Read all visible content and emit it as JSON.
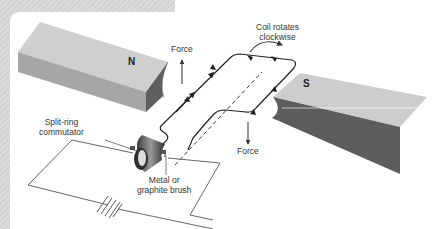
{
  "diagram": {
    "type": "dc-motor",
    "labels": {
      "coil_rotation_line1": "Coil rotates",
      "coil_rotation_line2": "clockwise",
      "force_top": "Force",
      "force_bottom": "Force",
      "north_pole": "N",
      "south_pole": "S",
      "commutator_line1": "Split-ring",
      "commutator_line2": "commutator",
      "brush_line1": "Metal or",
      "brush_line2": "graphite brush"
    },
    "colors": {
      "frame_hatch": "#d2d2d2",
      "magnet_top": "#cfcfcf",
      "magnet_front": "#a9a9a9",
      "magnet_side": "#5f5f5f",
      "wire": "#222222",
      "circuit_wire": "#555555",
      "background": "#ffffff"
    }
  }
}
